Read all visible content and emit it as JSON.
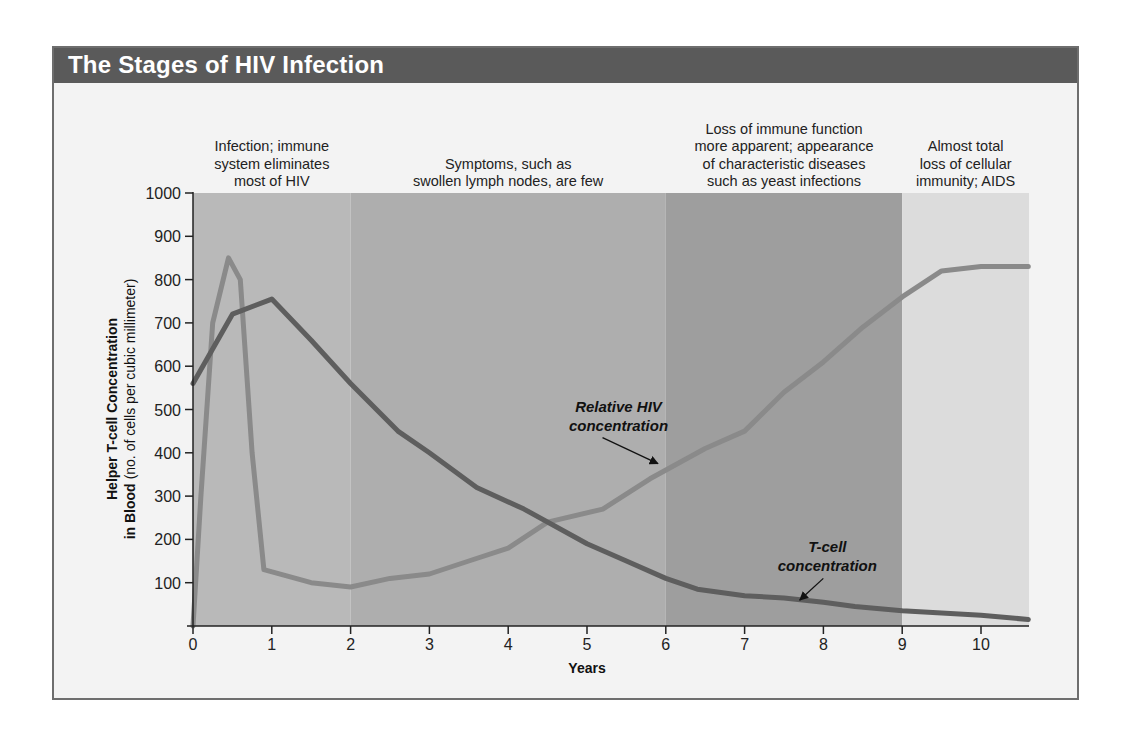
{
  "title": "The Stages of HIV Infection",
  "chart_data": {
    "type": "line",
    "title": "The Stages of HIV Infection",
    "xlabel": "Years",
    "ylabel_bold": "Helper T-cell Concentration in Blood",
    "ylabel_line1": "Helper T-cell Concentration",
    "ylabel_line2_bold": "in Blood",
    "ylabel_line2_rest": "(no. of cells per cubic millimeter)",
    "xlim": [
      0,
      10.6
    ],
    "ylim": [
      0,
      1000
    ],
    "x_ticks": [
      0,
      1,
      2,
      3,
      4,
      5,
      6,
      7,
      8,
      9,
      10
    ],
    "y_ticks": [
      100,
      200,
      300,
      400,
      500,
      600,
      700,
      800,
      900,
      1000
    ],
    "grid": false,
    "stages": [
      {
        "start": 0,
        "end": 2,
        "shade": "#b9b9b9",
        "label": [
          "Infection; immune",
          "system eliminates",
          "most of HIV"
        ]
      },
      {
        "start": 2,
        "end": 6,
        "shade": "#aeaeae",
        "label": [
          "Symptoms, such as",
          "swollen lymph nodes, are few"
        ]
      },
      {
        "start": 6,
        "end": 9,
        "shade": "#9e9e9e",
        "label": [
          "Loss of immune function",
          "more apparent; appearance",
          "of characteristic diseases",
          "such as yeast infections"
        ]
      },
      {
        "start": 9,
        "end": 10.6,
        "shade": "#dcdcdc",
        "label": [
          "Almost total",
          "loss of cellular",
          "immunity; AIDS"
        ]
      }
    ],
    "series": [
      {
        "name": "Relative HIV concentration",
        "color": "#8a8a8a",
        "label_lines": [
          "Relative HIV",
          "concentration"
        ],
        "arrow_to": [
          5.9,
          375
        ],
        "label_at": [
          5.4,
          495
        ],
        "x": [
          0,
          0.1,
          0.25,
          0.45,
          0.6,
          0.75,
          0.9,
          1.5,
          2,
          2.5,
          3,
          3.5,
          4,
          4.5,
          5.2,
          5.8,
          6.5,
          7,
          7.5,
          8,
          8.5,
          9,
          9.5,
          10,
          10.6
        ],
        "values": [
          0,
          300,
          700,
          850,
          800,
          400,
          130,
          100,
          90,
          110,
          120,
          150,
          180,
          240,
          270,
          340,
          410,
          450,
          540,
          610,
          690,
          760,
          820,
          830,
          830
        ]
      },
      {
        "name": "T-cell concentration",
        "color": "#5e5e5e",
        "label_lines": [
          "T-cell",
          "concentration"
        ],
        "arrow_to": [
          7.7,
          60
        ],
        "label_at": [
          8.05,
          170
        ],
        "x": [
          0,
          0.5,
          1,
          1.5,
          2,
          2.6,
          3,
          3.6,
          4.2,
          5,
          5.5,
          6,
          6.4,
          7,
          7.5,
          8,
          8.4,
          9,
          9.5,
          10,
          10.6
        ],
        "values": [
          560,
          720,
          755,
          660,
          560,
          450,
          400,
          320,
          270,
          190,
          150,
          110,
          85,
          70,
          65,
          55,
          45,
          35,
          30,
          25,
          15
        ]
      }
    ]
  }
}
